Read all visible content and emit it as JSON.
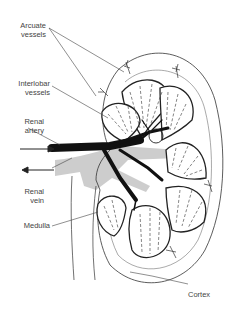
{
  "diagram": {
    "labels": {
      "arcuate_vessels": [
        "Arcuate",
        "vessels"
      ],
      "interlobar_vessels": [
        "Interlobar",
        "vessels"
      ],
      "renal_artery": [
        "Renal",
        "artery"
      ],
      "renal_vein": [
        "Renal",
        "vein"
      ],
      "medulla": "Medulla",
      "cortex": "Cortex"
    },
    "arrows": {
      "artery_flow": "inward",
      "vein_flow": "outward"
    },
    "colors": {
      "line": "#222222",
      "artery": "#111111",
      "vein": "#c8c8c8",
      "text": "#444444",
      "background": "#ffffff"
    }
  }
}
